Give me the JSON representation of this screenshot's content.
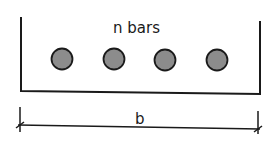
{
  "diagram": {
    "title_label": "n bars",
    "dimension_label": "b",
    "bar_count": 4,
    "colors": {
      "stroke": "#1a1a1a",
      "bar_fill": "#8c8c8c",
      "background": "#ffffff"
    }
  }
}
